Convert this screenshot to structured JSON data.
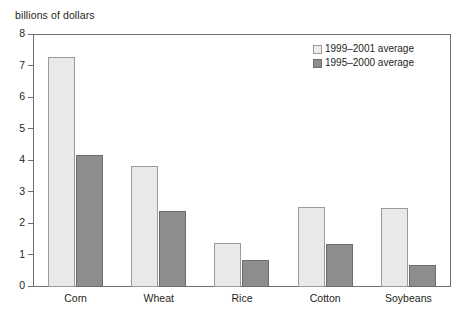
{
  "chart_data": {
    "type": "bar",
    "title": "",
    "ylabel": "billions of dollars",
    "xlabel": "",
    "ylim": [
      0,
      8
    ],
    "ytick_step": 1,
    "yticks": [
      8,
      7,
      6,
      5,
      4,
      3,
      2,
      1,
      0
    ],
    "grid": false,
    "legend_position": "top-right",
    "categories": [
      "Corn",
      "Wheat",
      "Rice",
      "Cotton",
      "Soybeans"
    ],
    "series": [
      {
        "name": "1999–2001 average",
        "color": "#e9e9e9",
        "border_color": "#9a9a9a",
        "values": [
          7.3,
          3.85,
          1.4,
          2.55,
          2.5
        ]
      },
      {
        "name": "1995–2000 average",
        "color": "#8d8d8d",
        "border_color": "#6d6d6d",
        "values": [
          4.2,
          2.4,
          0.85,
          1.35,
          0.7
        ]
      }
    ]
  },
  "axis": {
    "y_title": "billions of dollars"
  },
  "colors": {
    "series_light": "#e9e9e9",
    "series_dark": "#8d8d8d",
    "axis_line": "#6f6f6f",
    "text": "#231f20",
    "background": "#ffffff"
  }
}
